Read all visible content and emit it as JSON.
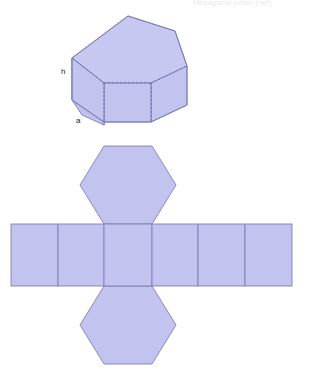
{
  "figure": {
    "clipped_header_text": "Hexagonal prism (net)",
    "colors": {
      "face_fill": "#c2c3ef",
      "face_fill_light": "#c7c8f1",
      "face_fill_dark": "#b9bae9",
      "edge_stroke": "#7f7fb4",
      "hidden_edge_stroke": "#6f6fa8",
      "label_text": "#1a1a1a",
      "background": "#ffffff"
    },
    "labels": {
      "height_label": "h",
      "apothem_label": "a"
    }
  },
  "solid": {
    "name": "hexagonal-prism",
    "label_height": "h",
    "label_base_edge": "a",
    "faces": [
      {
        "name": "top-face",
        "kind": "hexagon"
      },
      {
        "name": "front-left-face",
        "kind": "rectangle"
      },
      {
        "name": "front-center-face",
        "kind": "rectangle"
      },
      {
        "name": "front-right-face",
        "kind": "rectangle"
      },
      {
        "name": "upper-left-slant-face",
        "kind": "quad"
      },
      {
        "name": "upper-right-slant-face",
        "kind": "quad"
      }
    ],
    "hidden_edges": [
      {
        "name": "hidden-back-vertical-left"
      },
      {
        "name": "hidden-back-vertical-right"
      },
      {
        "name": "hidden-back-base-left"
      },
      {
        "name": "hidden-back-base-right"
      },
      {
        "name": "hidden-back-base-center"
      }
    ]
  },
  "net": {
    "name": "hexagonal-prism-net",
    "lateral_face_count": 6,
    "base_count": 2,
    "lateral_faces": [
      {
        "name": "net-rect-1"
      },
      {
        "name": "net-rect-2"
      },
      {
        "name": "net-rect-3"
      },
      {
        "name": "net-rect-4"
      },
      {
        "name": "net-rect-5"
      },
      {
        "name": "net-rect-6"
      }
    ],
    "bases": [
      {
        "name": "net-hexagon-top"
      },
      {
        "name": "net-hexagon-bottom"
      }
    ]
  }
}
